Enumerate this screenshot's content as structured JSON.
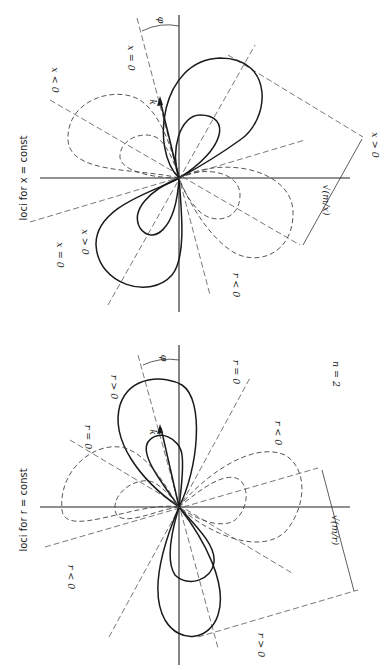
{
  "figure": {
    "orientation": "rotated 90 degrees (landscape printed sideways)",
    "top_panel": {
      "title": "loci for x = const",
      "labels": {
        "x_neg_top": "x < 0",
        "x_zero_top": "x = 0",
        "x_zero_bottom": "x = 0",
        "x_pos_bottom": "x > 0",
        "x_pos_right": "x > 0",
        "r_neg": "r < 0",
        "phi": "φ",
        "k": "k",
        "dimension": "√(m/x)"
      }
    },
    "bottom_panel": {
      "title": "loci for r = const",
      "labels": {
        "r_pos_top": "r > 0",
        "r_zero_left": "r = 0",
        "r_zero_right": "r = 0",
        "r_neg_right": "r < 0",
        "r_neg_left": "r < 0",
        "r_pos_bottom": "r > 0",
        "phi": "φ",
        "k": "k",
        "n": "n = 2",
        "dimension": "√(m/r)"
      }
    },
    "legend": {
      "solid": "positive loci",
      "dashed": "negative loci"
    }
  }
}
